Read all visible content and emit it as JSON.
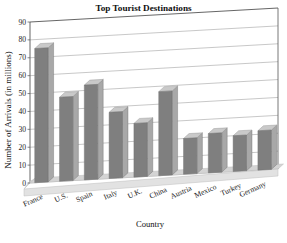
{
  "chart_data": {
    "type": "bar",
    "title": "Top Tourist Destinations",
    "xlabel": "Country",
    "ylabel": "Number of Arrivals (in millions)",
    "categories": [
      "France",
      "U.S.",
      "Spain",
      "Italy",
      "U.K.",
      "China",
      "Austria",
      "Mexico",
      "Turkey",
      "Germany"
    ],
    "values": [
      75,
      47,
      53,
      37,
      30,
      47,
      20,
      22,
      20,
      22
    ],
    "ylim": [
      0,
      90
    ],
    "yticks": [
      "0",
      "10",
      "20",
      "30",
      "40",
      "50",
      "60",
      "70",
      "80",
      "90"
    ],
    "ytick_values": [
      0,
      10,
      20,
      30,
      40,
      50,
      60,
      70,
      80,
      90
    ],
    "grid": true,
    "legend": "none",
    "style": "3d-column",
    "colors": {
      "bar_face": "#7f7f7f",
      "bar_top": "#c9c9c9",
      "bar_side": "#a8a8a8",
      "grid": "#9a9a9a",
      "axis": "#555555",
      "floor": "#d4d4d4",
      "floor_edge": "#bdbdbd",
      "background": "#ffffff"
    }
  }
}
